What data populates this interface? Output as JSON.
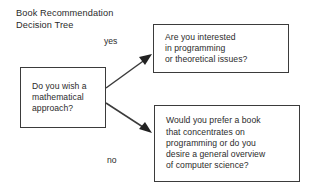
{
  "diagram": {
    "title": "Book Recommendation\nDecision Tree",
    "background_color": "#ffffff",
    "line_color": "#3b3b3b",
    "text_color": "#2b2b2b",
    "nodes": [
      {
        "id": "question",
        "role": "decision",
        "text": "Do you wish a\nmathematical\napproach?"
      },
      {
        "id": "yes_outcome",
        "role": "outcome",
        "text": "Are you interested\nin programming\nor theoretical issues?"
      },
      {
        "id": "no_outcome",
        "role": "outcome",
        "text": "Would you prefer a book\nthat concentrates on\nprogramming or do you\ndesire a general overview\nof computer science?"
      }
    ],
    "edges": [
      {
        "id": "edge_yes",
        "label": "yes",
        "from": "question",
        "to": "yes_outcome"
      },
      {
        "id": "edge_no",
        "label": "no",
        "from": "question",
        "to": "no_outcome"
      }
    ]
  }
}
